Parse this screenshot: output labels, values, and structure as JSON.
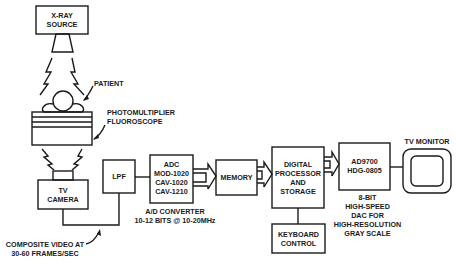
{
  "diagram": {
    "nodes": {
      "xray_source": [
        "X-RAY",
        "SOURCE"
      ],
      "patient": "PATIENT",
      "fluoroscope": [
        "PHOTOMULTIPLIER",
        "FLUOROSCOPE"
      ],
      "tv_camera": [
        "TV",
        "CAMERA"
      ],
      "lpf": "LPF",
      "adc": [
        "ADC",
        "MOD-1020",
        "CAV-1020",
        "CAV-1210"
      ],
      "memory": "MEMORY",
      "processor": [
        "DIGITAL",
        "PROCESSOR",
        "AND",
        "STORAGE"
      ],
      "keyboard": [
        "KEYBOARD",
        "CONTROL"
      ],
      "dac": [
        "AD9700",
        "HDG-0805"
      ],
      "tv_monitor": "TV MONITOR"
    },
    "annotations": {
      "composite_video": [
        "COMPOSITE VIDEO AT",
        "30-60 FRAMES/SEC"
      ],
      "ad_converter": [
        "A/D CONVERTER",
        "10-12 BITS @ 10-20MHz"
      ],
      "dac_desc": [
        "8-BIT",
        "HIGH-SPEED",
        "DAC FOR",
        "HIGH-RESOLUTION",
        "GRAY SCALE"
      ]
    },
    "colors": {
      "line": "#1a1a1a",
      "background": "#ffffff"
    }
  }
}
